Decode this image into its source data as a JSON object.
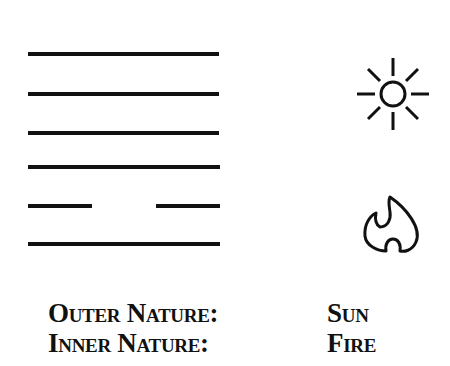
{
  "hexagram": {
    "lines": [
      {
        "position": 6,
        "type": "solid"
      },
      {
        "position": 5,
        "type": "solid"
      },
      {
        "position": 4,
        "type": "solid"
      },
      {
        "position": 3,
        "type": "solid"
      },
      {
        "position": 2,
        "type": "broken"
      },
      {
        "position": 1,
        "type": "solid"
      }
    ]
  },
  "icons": {
    "upper": "sun-icon",
    "lower": "fire-icon"
  },
  "natures": [
    {
      "label": "Outer Nature:",
      "value": "Sun"
    },
    {
      "label": "Inner Nature:",
      "value": "Fire"
    }
  ]
}
